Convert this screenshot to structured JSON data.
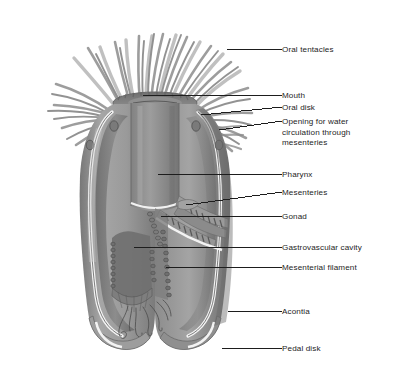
{
  "figure": {
    "style": "grayscale-airbrush-illustration",
    "background_color": "#ffffff",
    "ink_color": "#1d1d1d",
    "body_fill": "#8e8e8e",
    "body_shadow": "#6f6f6f",
    "body_highlight": "#b6b6b6",
    "lining_color": "#f2f2f2",
    "tentacle_color": "#8a8a8a",
    "leader_color": "#1d1d1d"
  },
  "labels": [
    {
      "id": "oral-tentacles",
      "text": "Oral tentacles",
      "x": 282,
      "y": 45,
      "leader": [
        282,
        49,
        227,
        49
      ]
    },
    {
      "id": "mouth",
      "text": "Mouth",
      "x": 282,
      "y": 91,
      "leader": [
        282,
        95,
        143,
        95
      ]
    },
    {
      "id": "oral-disk",
      "text": "Oral disk",
      "x": 282,
      "y": 103,
      "leader": [
        282,
        107,
        201,
        115
      ]
    },
    {
      "id": "opening-for-water",
      "text": "Opening for water\ncirculation through\nmesenteries",
      "x": 282,
      "y": 117,
      "leader": [
        282,
        121,
        219,
        130
      ]
    },
    {
      "id": "pharynx",
      "text": "Pharynx",
      "x": 282,
      "y": 170,
      "leader": [
        282,
        174,
        158,
        174
      ]
    },
    {
      "id": "mesenteries",
      "text": "Mesenteries",
      "x": 282,
      "y": 188,
      "leader": [
        282,
        192,
        186,
        205
      ]
    },
    {
      "id": "gonad",
      "text": "Gonad",
      "x": 282,
      "y": 212,
      "leader": [
        282,
        216,
        161,
        216
      ]
    },
    {
      "id": "gastrovascular-cavity",
      "text": "Gastrovascular cavity",
      "x": 282,
      "y": 243,
      "leader": [
        282,
        247,
        134,
        247
      ]
    },
    {
      "id": "mesenterial-filament",
      "text": "Mesenterial filament",
      "x": 282,
      "y": 263,
      "leader": [
        282,
        267,
        166,
        267
      ]
    },
    {
      "id": "acontia",
      "text": "Acontia",
      "x": 282,
      "y": 307,
      "leader": [
        282,
        311,
        228,
        311
      ]
    },
    {
      "id": "pedal-disk",
      "text": "Pedal disk",
      "x": 282,
      "y": 344,
      "leader": [
        282,
        348,
        222,
        348
      ]
    }
  ],
  "anatomy_parts": [
    "oral tentacles",
    "mouth",
    "oral disk",
    "opening for water circulation through mesenteries",
    "pharynx",
    "mesenteries",
    "gonad",
    "gastrovascular cavity",
    "mesenterial filament",
    "acontia",
    "pedal disk"
  ]
}
